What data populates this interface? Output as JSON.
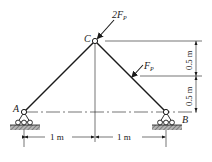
{
  "diagram": {
    "type": "truss-structure",
    "nodes": {
      "A": {
        "label": "A"
      },
      "B": {
        "label": "B"
      },
      "C": {
        "label": "C"
      }
    },
    "loads": {
      "at_C": {
        "label_main": "2F",
        "label_sub": "P"
      },
      "on_CB": {
        "label_main": "F",
        "label_sub": "P"
      }
    },
    "dimensions": {
      "horizontal_left": "1 m",
      "horizontal_right": "1 m",
      "vertical_top": "0.5 m",
      "vertical_bottom": "0.5 m"
    },
    "colors": {
      "line": "#1a1a1a",
      "ground_hatch": "#7a7a7a"
    }
  }
}
